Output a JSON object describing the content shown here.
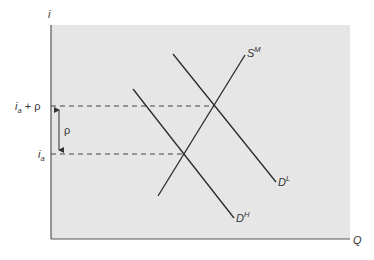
{
  "diagram": {
    "type": "economics-supply-demand",
    "axes": {
      "y_label": "i",
      "x_label": "Q"
    },
    "curves": [
      {
        "id": "supply",
        "label_base": "S",
        "label_sup": "M"
      },
      {
        "id": "demand_low",
        "label_base": "D",
        "label_sup": "L"
      },
      {
        "id": "demand_high",
        "label_base": "D",
        "label_sup": "H"
      }
    ],
    "levels": {
      "upper": {
        "base": "i",
        "sub": "a",
        "suffix": " + ρ"
      },
      "lower": {
        "base": "i",
        "sub": "a"
      }
    },
    "gap_label": "ρ",
    "colors": {
      "plot_background": "#e6e6e6",
      "line": "#2a2a2a",
      "axis": "#555555"
    }
  }
}
